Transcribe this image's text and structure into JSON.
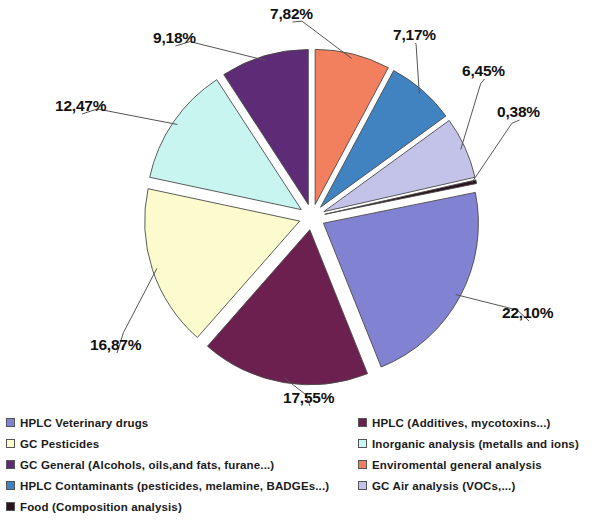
{
  "chart_data": {
    "type": "pie",
    "title": "",
    "subtitle": "",
    "xlabel": "",
    "ylabel": "",
    "grid": false,
    "legend_position": "bottom",
    "exploded": true,
    "value_suffix": "%",
    "decimal_separator": ",",
    "categories": [
      "Enviromental general analysis",
      "HPLC Contaminants (pesticides, melamine, BADGEs...)",
      "GC Air analysis (VOCs,...)",
      "Food (Composition analysis)",
      "HPLC Veterinary drugs",
      "HPLC (Additives, mycotoxins...)",
      "GC Pesticides",
      "Inorganic analysis (metalls and ions)",
      "GC General (Alcohols, oils, and fats, furane...)"
    ],
    "values": [
      7.82,
      7.17,
      6.45,
      0.38,
      22.1,
      17.55,
      16.87,
      12.47,
      9.18
    ],
    "labels": [
      "7,82%",
      "7,17%",
      "6,45%",
      "0,38%",
      "22,10%",
      "17,55%",
      "16,87%",
      "12,47%",
      "9,18%"
    ],
    "colors": [
      "#f2805f",
      "#4182c1",
      "#c3c3ea",
      "#2b1320",
      "#8282d2",
      "#6c2050",
      "#fbfbcd",
      "#c9f5f1",
      "#5e2b77"
    ],
    "slices": [
      {
        "label": "7,82%",
        "value": 7.82,
        "color": "#f2805f",
        "category": "Enviromental general analysis"
      },
      {
        "label": "7,17%",
        "value": 7.17,
        "color": "#4182c1",
        "category": "HPLC Contaminants (pesticides, melamine, BADGEs...)"
      },
      {
        "label": "6,45%",
        "value": 6.45,
        "color": "#c3c3ea",
        "category": "GC Air analysis (VOCs,...)"
      },
      {
        "label": "0,38%",
        "value": 0.38,
        "color": "#2b1320",
        "category": "Food (Composition analysis)"
      },
      {
        "label": "22,10%",
        "value": 22.1,
        "color": "#8282d2",
        "category": "HPLC Veterinary drugs"
      },
      {
        "label": "17,55%",
        "value": 17.55,
        "color": "#6c2050",
        "category": "HPLC (Additives, mycotoxins...)"
      },
      {
        "label": "16,87%",
        "value": 16.87,
        "color": "#fbfbcd",
        "category": "GC Pesticides"
      },
      {
        "label": "12,47%",
        "value": 12.47,
        "color": "#c9f5f1",
        "category": "Inorganic analysis (metalls and ions)"
      },
      {
        "label": "9,18%",
        "value": 9.18,
        "color": "#5e2b77",
        "category": "GC General (Alcohols, oils, and fats, furane...)"
      }
    ]
  },
  "pct_labels": [
    {
      "text": "7,82%",
      "x": 270,
      "y": 5
    },
    {
      "text": "7,17%",
      "x": 393,
      "y": 26
    },
    {
      "text": "6,45%",
      "x": 462,
      "y": 62
    },
    {
      "text": "0,38%",
      "x": 497,
      "y": 103
    },
    {
      "text": "22,10%",
      "x": 502,
      "y": 304
    },
    {
      "text": "17,55%",
      "x": 283,
      "y": 389
    },
    {
      "text": "16,87%",
      "x": 90,
      "y": 336
    },
    {
      "text": "12,47%",
      "x": 55,
      "y": 97
    },
    {
      "text": "9,18%",
      "x": 153,
      "y": 29
    }
  ],
  "legend": {
    "left_column": [
      {
        "label": "HPLC Veterinary drugs",
        "color": "#8282d2"
      },
      {
        "label": "GC Pesticides",
        "color": "#fbfbcd"
      },
      {
        "label": "GC General (Alcohols, oils,and fats, furane...)",
        "color": "#5e2b77"
      },
      {
        "label": "HPLC Contaminants (pesticides, melamine, BADGEs...)",
        "color": "#4182c1"
      },
      {
        "label": "Food (Composition analysis)",
        "color": "#2b1320"
      }
    ],
    "right_column": [
      {
        "label": "HPLC (Additives, mycotoxins...)",
        "color": "#6c2050"
      },
      {
        "label": "Inorganic analysis (metalls and ions)",
        "color": "#c9f5f1"
      },
      {
        "label": "Enviromental general analysis",
        "color": "#f2805f"
      },
      {
        "label": "GC Air analysis (VOCs,...)",
        "color": "#c3c3ea"
      }
    ]
  }
}
